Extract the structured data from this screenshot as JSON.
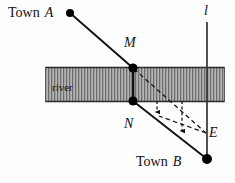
{
  "figure": {
    "width": 235,
    "height": 183,
    "background_color": "#fdfdfd"
  },
  "labels": {
    "town_a_prefix": "Town",
    "town_a_point": "A",
    "town_b_prefix": "Town",
    "town_b_point": "B",
    "point_m": "M",
    "point_n": "N",
    "point_e": "E",
    "line_l": "l",
    "river": "river"
  },
  "colors": {
    "stroke": "#111111",
    "river_fill": "#b3b3b3",
    "river_hatch": "#4d4d4d",
    "river_border": "#333333",
    "dot_fill": "#000000",
    "dashed": "#1a1a1a"
  },
  "geometry": {
    "river_band": {
      "x": 45,
      "y": 67,
      "width": 180,
      "height": 35
    },
    "points": {
      "A": {
        "x": 70,
        "y": 13,
        "r": 4
      },
      "M": {
        "x": 133,
        "y": 68,
        "r": 4.5
      },
      "N": {
        "x": 133,
        "y": 101,
        "r": 4.5
      },
      "B": {
        "x": 207,
        "y": 159,
        "r": 5
      }
    },
    "line_l": {
      "x": 207,
      "y1": 22,
      "y2": 160
    },
    "segments": [
      {
        "name": "A-to-M",
        "x1": 70,
        "y1": 13,
        "x2": 133,
        "y2": 68
      },
      {
        "name": "M-to-N",
        "x1": 133,
        "y1": 68,
        "x2": 133,
        "y2": 101
      },
      {
        "name": "N-to-B",
        "x1": 133,
        "y1": 101,
        "x2": 207,
        "y2": 159
      }
    ],
    "dashed_segments": [
      {
        "name": "M-to-E",
        "x1": 134,
        "y1": 69,
        "x2": 206,
        "y2": 133
      },
      {
        "name": "E-to-left-arrow",
        "x1": 206,
        "y1": 133,
        "x2": 158,
        "y2": 116
      }
    ],
    "arrows": [
      {
        "name": "arrow-inner",
        "x": 157,
        "y1": 101,
        "y2": 117
      },
      {
        "name": "arrow-outer",
        "x": 182,
        "y1": 101,
        "y2": 136
      }
    ]
  }
}
